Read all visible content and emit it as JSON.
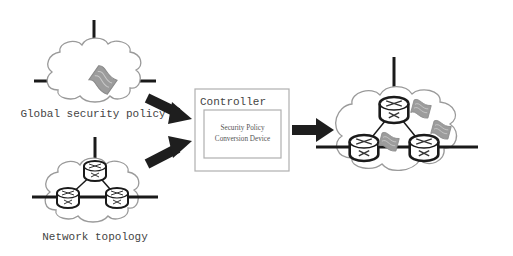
{
  "diagram": {
    "inputs": {
      "policy_label": "Global security policy",
      "topology_label": "Network topology"
    },
    "controller": {
      "title": "Controller",
      "device_line1": "Security Policy",
      "device_line2": "Conversion Device"
    },
    "colors": {
      "line": "#1a1a1a",
      "cloud_stroke": "#9a9a9a",
      "flag_fill": "#9c9c9c",
      "arrow": "#1e1e1e",
      "box_stroke": "#b0b0b0",
      "text": "#444444"
    }
  }
}
